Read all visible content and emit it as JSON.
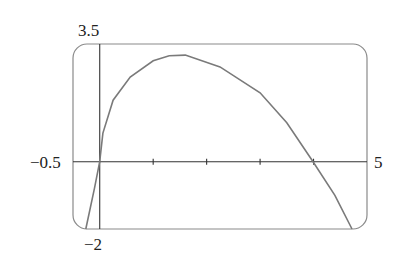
{
  "chart_data": {
    "type": "line",
    "title": "",
    "xlabel": "",
    "ylabel": "",
    "xlim": [
      -0.5,
      5
    ],
    "ylim": [
      -2,
      3.5
    ],
    "grid": false,
    "x_ticks": [
      1,
      2,
      3,
      4
    ],
    "axis_labels": {
      "x_min": "−0.5",
      "x_max": "5",
      "y_max": "3.5",
      "y_min": "−2"
    },
    "series": [
      {
        "name": "f(x)",
        "x": [
          -0.26,
          -0.1,
          0.0,
          0.06,
          0.25,
          0.57,
          1.0,
          1.3,
          1.6,
          2.25,
          3.0,
          3.5,
          3.97,
          4.4,
          4.72
        ],
        "y": [
          -2.0,
          -0.8,
          0.0,
          0.85,
          1.83,
          2.52,
          3.0,
          3.15,
          3.17,
          2.82,
          2.05,
          1.16,
          0.05,
          -1.0,
          -2.0
        ]
      }
    ],
    "colors": {
      "curve": "#7a7a7a",
      "axes": "#333333",
      "frame": "#8a8a8a"
    }
  }
}
